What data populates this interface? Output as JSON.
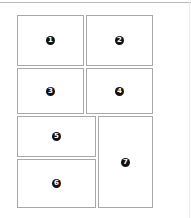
{
  "diagram": {
    "type": "page-layout-grid",
    "colors": {
      "panel_border": "#a8a8a8",
      "marker_fill": "#111111",
      "marker_text": "#ffffff",
      "top_rule": "#b8b8b8"
    },
    "panels": [
      {
        "id": 1,
        "label": "1",
        "x": 17,
        "y": 15,
        "w": 67,
        "h": 51
      },
      {
        "id": 2,
        "label": "2",
        "x": 86,
        "y": 15,
        "w": 67,
        "h": 51
      },
      {
        "id": 3,
        "label": "3",
        "x": 17,
        "y": 68,
        "w": 67,
        "h": 46
      },
      {
        "id": 4,
        "label": "4",
        "x": 86,
        "y": 68,
        "w": 67,
        "h": 46
      },
      {
        "id": 5,
        "label": "5",
        "x": 17,
        "y": 116,
        "w": 79,
        "h": 41
      },
      {
        "id": 6,
        "label": "6",
        "x": 17,
        "y": 159,
        "w": 79,
        "h": 49
      },
      {
        "id": 7,
        "label": "7",
        "x": 98,
        "y": 116,
        "w": 55,
        "h": 92
      }
    ]
  }
}
